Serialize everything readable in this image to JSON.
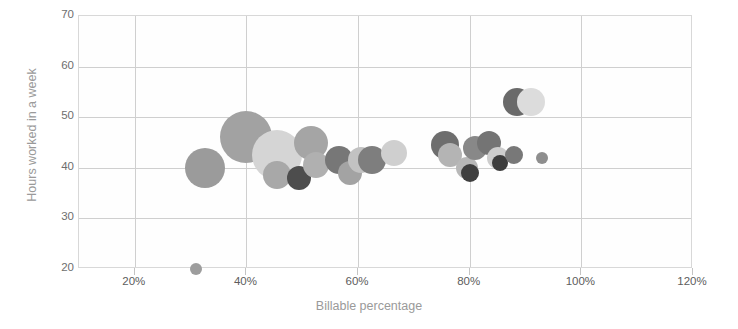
{
  "chart_data": {
    "type": "scatter",
    "title": "",
    "xlabel": "Billable percentage",
    "ylabel": "Hours worked in a week",
    "xlim": [
      10,
      120
    ],
    "ylim": [
      20,
      70
    ],
    "grid": true,
    "legend": "none",
    "x_tick_labels": [
      "20%",
      "40%",
      "60%",
      "80%",
      "100%",
      "120%"
    ],
    "x_tick_values": [
      20,
      40,
      60,
      80,
      100,
      120
    ],
    "y_tick_labels": [
      "20",
      "30",
      "40",
      "50",
      "60",
      "70"
    ],
    "y_tick_values": [
      20,
      30,
      40,
      50,
      60,
      70
    ],
    "bubble_size_unit": "radius in px (relative headcount)",
    "points": [
      {
        "x": 31.0,
        "y": 20.0,
        "r": 6,
        "color": "#9d9d9d"
      },
      {
        "x": 32.5,
        "y": 40.0,
        "r": 20,
        "color": "#9b9b9b"
      },
      {
        "x": 40.0,
        "y": 46.0,
        "r": 26,
        "color": "#a2a2a2"
      },
      {
        "x": 45.5,
        "y": 42.5,
        "r": 25,
        "color": "#d5d5d5"
      },
      {
        "x": 45.5,
        "y": 38.5,
        "r": 14,
        "color": "#a8a8a8"
      },
      {
        "x": 49.5,
        "y": 38.0,
        "r": 12,
        "color": "#4d4d4d"
      },
      {
        "x": 51.5,
        "y": 45.0,
        "r": 17,
        "color": "#a5a5a5"
      },
      {
        "x": 52.5,
        "y": 40.5,
        "r": 13,
        "color": "#b0b0b0"
      },
      {
        "x": 56.5,
        "y": 41.5,
        "r": 14,
        "color": "#777777"
      },
      {
        "x": 58.5,
        "y": 39.0,
        "r": 12,
        "color": "#a3a3a3"
      },
      {
        "x": 60.5,
        "y": 41.5,
        "r": 13,
        "color": "#c2c2c2"
      },
      {
        "x": 62.5,
        "y": 41.5,
        "r": 14,
        "color": "#7e7e7e"
      },
      {
        "x": 66.5,
        "y": 43.0,
        "r": 13,
        "color": "#cfcfcf"
      },
      {
        "x": 75.5,
        "y": 44.5,
        "r": 14,
        "color": "#6e6e6e"
      },
      {
        "x": 76.5,
        "y": 42.5,
        "r": 12,
        "color": "#b4b4b4"
      },
      {
        "x": 79.5,
        "y": 40.0,
        "r": 11,
        "color": "#b8b8b8"
      },
      {
        "x": 80.0,
        "y": 39.0,
        "r": 9,
        "color": "#3f3f3f"
      },
      {
        "x": 81.0,
        "y": 44.0,
        "r": 12,
        "color": "#888888"
      },
      {
        "x": 83.5,
        "y": 45.0,
        "r": 12,
        "color": "#747474"
      },
      {
        "x": 85.0,
        "y": 42.0,
        "r": 11,
        "color": "#cdcdcd"
      },
      {
        "x": 85.5,
        "y": 41.0,
        "r": 8,
        "color": "#3d3d3d"
      },
      {
        "x": 88.0,
        "y": 42.5,
        "r": 9,
        "color": "#787878"
      },
      {
        "x": 88.5,
        "y": 53.0,
        "r": 14,
        "color": "#6a6a6a"
      },
      {
        "x": 91.0,
        "y": 53.0,
        "r": 14,
        "color": "#dcdcdc"
      },
      {
        "x": 93.0,
        "y": 42.0,
        "r": 6,
        "color": "#8e8e8e"
      }
    ]
  },
  "theme": {
    "grid_color": "#cfcfcf",
    "frame_color": "#d8d8d8",
    "axis_label_color": "#9a9a9a",
    "tick_label_color": "#5d5d5d",
    "background": "#ffffff"
  }
}
